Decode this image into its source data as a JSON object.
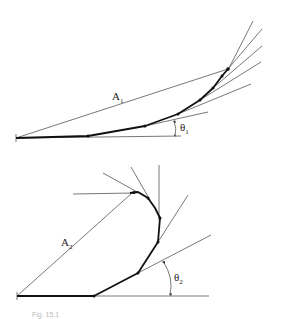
{
  "figure_top": {
    "chord_label": "A",
    "chord_sub": "1",
    "angle_label": "θ",
    "angle_sub": "1"
  },
  "figure_bottom": {
    "chord_label": "A",
    "chord_sub": "2",
    "angle_label": "θ",
    "angle_sub": "2"
  },
  "caption": "Fig. 15.1"
}
